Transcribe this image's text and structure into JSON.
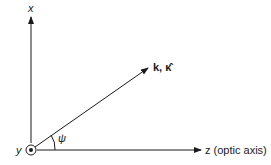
{
  "diagram": {
    "axes": {
      "x_label": "x",
      "y_label": "y",
      "z_label": "z (optic axis)"
    },
    "vector_label": "k, κ̂",
    "angle_label": "ψ",
    "colors": {
      "line": "#1a1a1a",
      "background": "#ffffff"
    }
  }
}
